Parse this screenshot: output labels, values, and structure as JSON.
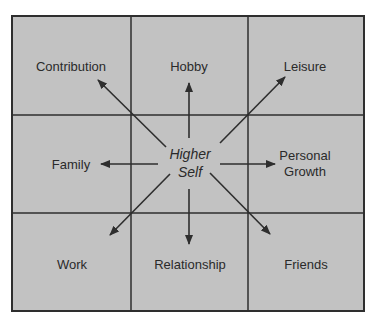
{
  "diagram": {
    "type": "3x3 grid with radiating arrows",
    "background_color": "#c2c2c2",
    "line_color": "#2e2e2e",
    "center": {
      "line1": "Higher",
      "line2": "Self"
    },
    "cells": {
      "top_left": "Contribution",
      "top_center": "Hobby",
      "top_right": "Leisure",
      "middle_left": "Family",
      "middle_right_line1": "Personal",
      "middle_right_line2": "Growth",
      "bottom_left": "Work",
      "bottom_center": "Relationship",
      "bottom_right": "Friends"
    }
  }
}
